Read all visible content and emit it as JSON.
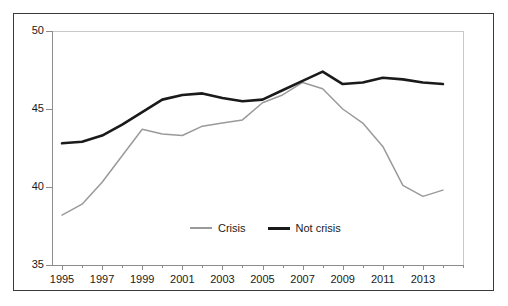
{
  "chart_data": {
    "type": "line",
    "title": "",
    "subtitle": "",
    "xlabel": "",
    "ylabel": "",
    "xlim": [
      1994.5,
      2015.0
    ],
    "ylim": [
      35,
      50
    ],
    "yticks": [
      35,
      40,
      45,
      50
    ],
    "xticks": [
      1995,
      1997,
      1999,
      2001,
      2003,
      2005,
      2007,
      2009,
      2011,
      2013
    ],
    "xtick_labels": [
      "1995",
      "1997",
      "1999",
      "2001",
      "2003",
      "2005",
      "2007",
      "2009",
      "2011",
      "2013"
    ],
    "ytick_labels": [
      "35",
      "40",
      "45",
      "50"
    ],
    "grid": false,
    "legend_position": "bottom-center",
    "x": [
      1995,
      1996,
      1997,
      1998,
      1999,
      2000,
      2001,
      2002,
      2003,
      2004,
      2005,
      2006,
      2007,
      2008,
      2009,
      2010,
      2011,
      2012,
      2013,
      2014
    ],
    "series": [
      {
        "name": "Crisis",
        "color": "#9a9a9a",
        "line_width": 1.5,
        "values": [
          38.2,
          38.9,
          40.3,
          42.0,
          43.7,
          43.4,
          43.3,
          43.9,
          44.1,
          44.3,
          45.4,
          45.9,
          46.7,
          46.3,
          45.0,
          44.1,
          42.6,
          40.1,
          39.4,
          39.8
        ]
      },
      {
        "name": "Not crisis",
        "color": "#1a1a1a",
        "line_width": 2.6,
        "values": [
          42.8,
          42.9,
          43.3,
          44.0,
          44.8,
          45.6,
          45.9,
          46.0,
          45.7,
          45.5,
          45.6,
          46.2,
          46.8,
          47.4,
          46.6,
          46.7,
          47.0,
          46.9,
          46.7,
          46.6
        ]
      }
    ],
    "annotations": []
  },
  "legend": {
    "entries": [
      {
        "label": "Crisis",
        "swatch": "crisis-line-swatch"
      },
      {
        "label": "Not crisis",
        "swatch": "not-crisis-line-swatch"
      }
    ]
  },
  "axes": {
    "y_labels": [
      "50",
      "45",
      "40",
      "35"
    ],
    "x_labels": [
      "1995",
      "1997",
      "1999",
      "2001",
      "2003",
      "2005",
      "2007",
      "2009",
      "2011",
      "2013"
    ]
  },
  "colors": {
    "crisis": "#9a9a9a",
    "not_crisis": "#1a1a1a",
    "axis": "#8c8c8c",
    "frame": "#3b3b3b",
    "panel_border": "#c9c9c9",
    "background": "#ffffff"
  }
}
